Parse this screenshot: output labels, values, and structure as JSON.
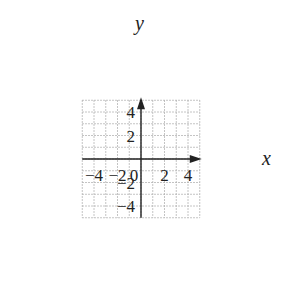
{
  "chart_data": {
    "type": "scatter",
    "title": "",
    "xlabel": "x",
    "ylabel": "y",
    "xlim": [
      -5,
      5
    ],
    "ylim": [
      -5,
      5
    ],
    "grid": true,
    "grid_style": "dotted",
    "x_ticks": [
      -4,
      -2,
      0,
      2,
      4
    ],
    "y_ticks": [
      -4,
      -2,
      2,
      4
    ],
    "x_tick_labels": [
      "−4",
      "−2",
      "0",
      "2",
      "4"
    ],
    "y_tick_labels": [
      "−4",
      "−2",
      "2",
      "4"
    ],
    "series": [],
    "legend": null
  },
  "colors": {
    "axis": "#222222",
    "grid": "#b0b0b0",
    "background": "#ffffff"
  },
  "labels": {
    "x_axis": "x",
    "y_axis": "y"
  }
}
